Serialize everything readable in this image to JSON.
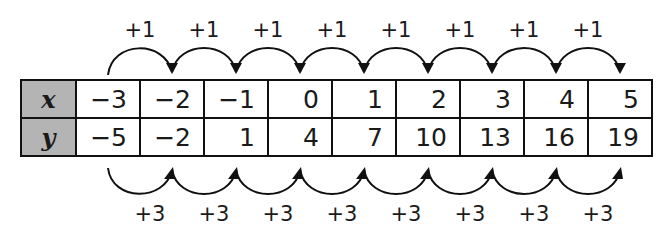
{
  "table": {
    "x_header": "x",
    "y_header": "y",
    "x_values": [
      "−3",
      "−2",
      "−1",
      "0",
      "1",
      "2",
      "3",
      "4",
      "5"
    ],
    "y_values": [
      "−5",
      "−2",
      "1",
      "4",
      "7",
      "10",
      "13",
      "16",
      "19"
    ]
  },
  "top_arrows": {
    "labels": [
      "+1",
      "+1",
      "+1",
      "+1",
      "+1",
      "+1",
      "+1",
      "+1"
    ]
  },
  "bottom_arrows": {
    "labels": [
      "+3",
      "+3",
      "+3",
      "+3",
      "+3",
      "+3",
      "+3",
      "+3"
    ]
  },
  "colors": {
    "header_fill": "#b4b4b4",
    "line": "#111111"
  }
}
